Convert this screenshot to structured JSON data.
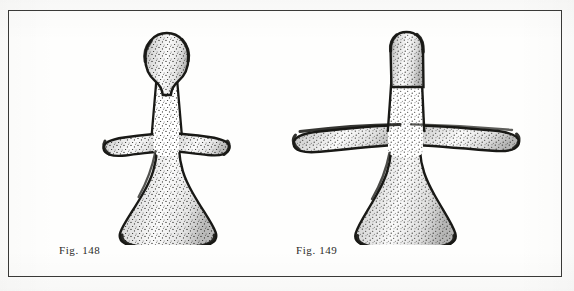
{
  "plate": {
    "background_color": "#fdfdfc",
    "frame_color": "#3a3a38",
    "medium": "stipple line drawing",
    "subject": "two stylized anthropomorphic figurines"
  },
  "figures": [
    {
      "id": "figure-148",
      "caption": "Fig. 148",
      "description": "Stylized anthropomorphic figurine with bulbous ovoid head, narrow neck, short outstretched arms and flaring bell-shaped lower body",
      "head_shape": "ovoid bulb",
      "arm_style": "short tapered stubs",
      "base_shape": "flared bell with concave sides",
      "ink_color": "#1a1a18",
      "stipple_color": "#2b2b28"
    },
    {
      "id": "figure-149",
      "caption": "Fig. 149",
      "description": "Stylized anthropomorphic figurine with cylindrical rounded head, long horizontal cross-like arms and flaring bell-shaped lower body",
      "head_shape": "rounded cylinder",
      "arm_style": "long horizontal cruciform bars",
      "base_shape": "flared bell with concave sides",
      "ink_color": "#1a1a18",
      "stipple_color": "#2b2b28"
    }
  ]
}
